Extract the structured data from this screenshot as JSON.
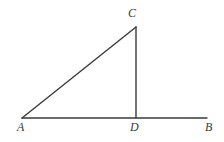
{
  "figure": {
    "background_color": "#ffffff",
    "stroke_color": "#3a3a3a",
    "stroke_width": 1.4,
    "canvas": {
      "width": 224,
      "height": 142
    },
    "points": {
      "A": {
        "label": "A",
        "x": 22,
        "y": 118
      },
      "B": {
        "label": "B",
        "x": 207,
        "y": 118
      },
      "C": {
        "label": "C",
        "x": 136,
        "y": 27
      },
      "D": {
        "label": "D",
        "x": 136,
        "y": 118
      }
    },
    "segments": [
      {
        "name": "AC",
        "from": "A",
        "to": "C",
        "x1": 22,
        "y1": 118,
        "x2": 136,
        "y2": 27
      },
      {
        "name": "CD",
        "from": "C",
        "to": "D",
        "x1": 136,
        "y1": 27,
        "x2": 136,
        "y2": 118
      },
      {
        "name": "AB",
        "from": "A",
        "to": "B",
        "x1": 22,
        "y1": 118,
        "x2": 207,
        "y2": 118
      }
    ],
    "labels": {
      "A": "A",
      "B": "B",
      "C": "C",
      "D": "D"
    }
  }
}
